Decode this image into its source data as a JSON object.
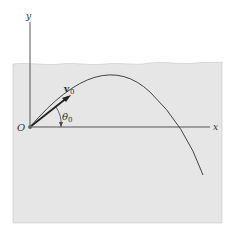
{
  "diagram": {
    "type": "projectile-motion",
    "labels": {
      "y_axis": "y",
      "x_axis": "x",
      "origin": "O",
      "velocity": "v",
      "velocity_sub": "0",
      "angle": "θ",
      "angle_sub": "0"
    },
    "colors": {
      "background": "#ffffff",
      "region": "#e6e6e6",
      "line": "#444444"
    }
  }
}
